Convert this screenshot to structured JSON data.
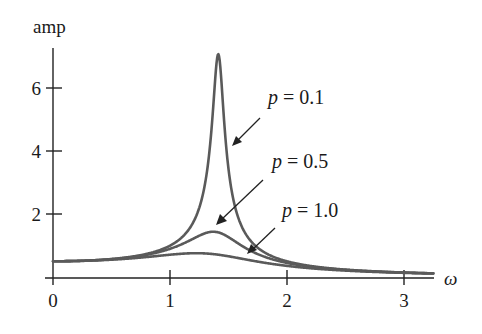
{
  "chart_data": {
    "type": "line",
    "title": "",
    "xlabel": "ω",
    "ylabel": "amp",
    "xlim": [
      0,
      3.25
    ],
    "ylim": [
      0,
      7.5
    ],
    "grid": false,
    "x_ticks": [
      0,
      1,
      2,
      3
    ],
    "x_tick_labels": [
      "0",
      "1",
      "2",
      "3"
    ],
    "y_ticks": [
      2,
      4,
      6
    ],
    "y_tick_labels": [
      "2",
      "4",
      "6"
    ],
    "x": [
      0,
      0.25,
      0.5,
      0.75,
      1.0,
      1.2,
      1.3,
      1.35,
      1.4,
      1.414,
      1.45,
      1.5,
      1.6,
      1.75,
      2.0,
      2.5,
      3.0,
      3.25
    ],
    "series": [
      {
        "name": "p = 0.1",
        "p": 0.1,
        "values": [
          0.5,
          0.52,
          0.57,
          0.69,
          0.99,
          1.69,
          2.82,
          4.04,
          6.25,
          7.07,
          5.4,
          3.5,
          1.78,
          0.96,
          0.49,
          0.24,
          0.14,
          0.12
        ]
      },
      {
        "name": "p = 0.5",
        "p": 0.5,
        "values": [
          0.5,
          0.52,
          0.57,
          0.67,
          0.89,
          1.17,
          1.33,
          1.39,
          1.42,
          1.41,
          1.39,
          1.32,
          1.13,
          0.87,
          0.52,
          0.24,
          0.14,
          0.12
        ]
      },
      {
        "name": "p = 1.0",
        "p": 1.0,
        "values": [
          0.5,
          0.51,
          0.54,
          0.6,
          0.71,
          0.74,
          0.74,
          0.73,
          0.72,
          0.71,
          0.7,
          0.68,
          0.63,
          0.55,
          0.42,
          0.23,
          0.14,
          0.11
        ]
      }
    ],
    "annotations": [
      {
        "text_var": "p",
        "text_rest": " = 0.1",
        "points_to": "p = 0.1 curve"
      },
      {
        "text_var": "p",
        "text_rest": " = 0.5",
        "points_to": "p = 0.5 curve"
      },
      {
        "text_var": "p",
        "text_rest": " = 1.0",
        "points_to": "p = 1.0 curve"
      }
    ],
    "colors": {
      "curve": "#5a5a5a",
      "axis": "#222222",
      "text": "#1a1a1a"
    }
  }
}
